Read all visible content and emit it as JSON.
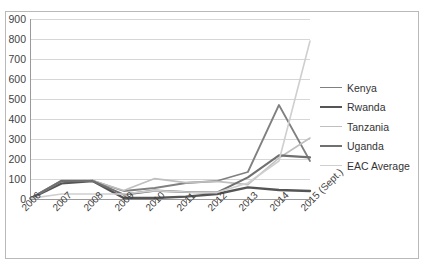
{
  "top_cut_text": "",
  "legend": {
    "position": "right",
    "entries": [
      {
        "label": "Kenya",
        "color": "#808080",
        "width": 1.8
      },
      {
        "label": "Rwanda",
        "color": "#555555",
        "width": 2.4
      },
      {
        "label": "Tanzania",
        "color": "#bfbfbf",
        "width": 1.6
      },
      {
        "label": "Uganda",
        "color": "#707070",
        "width": 2.1
      },
      {
        "label": "EAC Average",
        "color": "#cfcfcf",
        "width": 1.6
      }
    ]
  },
  "axis": {
    "y_ticks": [
      "0",
      "100",
      "200",
      "300",
      "400",
      "500",
      "600",
      "700",
      "800",
      "900"
    ],
    "x_ticks": [
      "2006",
      "2007",
      "2008",
      "2009",
      "2010",
      "2011",
      "2012",
      "2013",
      "2014",
      "2015 (Sept.)"
    ]
  },
  "chart_data": {
    "type": "line",
    "title": "",
    "xlabel": "",
    "ylabel": "",
    "ylim": [
      0,
      900
    ],
    "ytick_step": 100,
    "grid": true,
    "legend_position": "right",
    "categories": [
      "2006",
      "2007",
      "2008",
      "2009",
      "2010",
      "2011",
      "2012",
      "2013",
      "2014",
      "2015 (Sept.)"
    ],
    "series": [
      {
        "name": "Kenya",
        "color": "#808080",
        "width": 1.8,
        "values": [
          3,
          92,
          92,
          40,
          55,
          80,
          90,
          135,
          470,
          190
        ]
      },
      {
        "name": "Rwanda",
        "color": "#555555",
        "width": 2.4,
        "values": [
          3,
          78,
          90,
          5,
          5,
          12,
          25,
          58,
          45,
          40
        ]
      },
      {
        "name": "Tanzania",
        "color": "#bfbfbf",
        "width": 1.6,
        "values": [
          3,
          88,
          92,
          42,
          102,
          82,
          88,
          72,
          205,
          305
        ]
      },
      {
        "name": "Uganda",
        "color": "#707070",
        "width": 2.1,
        "values": [
          3,
          90,
          90,
          22,
          42,
          35,
          32,
          108,
          218,
          208
        ]
      },
      {
        "name": "EAC Average",
        "color": "#cfcfcf",
        "width": 1.6,
        "values": [
          3,
          25,
          25,
          25,
          42,
          35,
          32,
          80,
          190,
          790
        ]
      }
    ]
  }
}
